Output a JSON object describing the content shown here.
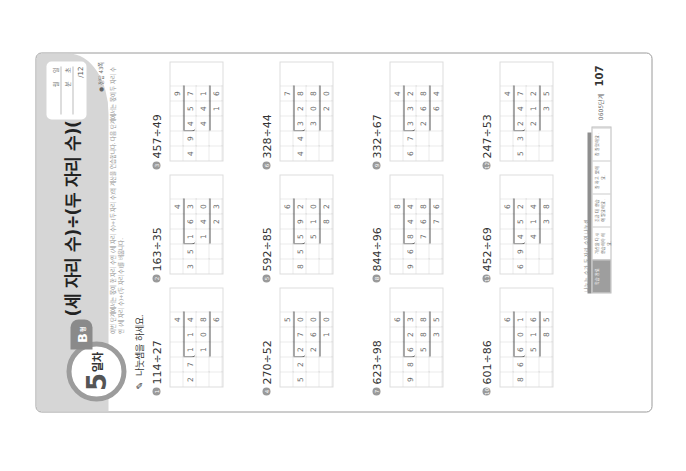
{
  "header": {
    "title": "(세 자리 수)÷(두 자리 수)(1)",
    "day_number": "5",
    "day_label": "일차",
    "type_letter": "B",
    "type_suffix": "형",
    "score_box": {
      "month_label": "월",
      "day_label": "일",
      "minute_label": "분",
      "second_label": "초",
      "total": "/12"
    },
    "answer_ref": "● 정답 43쪽",
    "description": "이번 단계에서는 몫이 한 자리 수인 (세 자리 수)÷(두 자리 수)의 계산을 연습합니다. 다음 단계에서는 몫이 두 자리 수인 (세 자리 수)÷(두 자리 수)를 배웁니다."
  },
  "prompt": {
    "icon": "pencil-icon",
    "text": "나눗셈을 하세요."
  },
  "problems": [
    {
      "num": "1",
      "label": "114÷27",
      "divisor": [
        "2",
        "7"
      ],
      "dividend": [
        "1",
        "1",
        "4"
      ],
      "quotient": "4",
      "product": [
        "1",
        "0",
        "8"
      ],
      "remainder": [
        "",
        "",
        "6"
      ]
    },
    {
      "num": "2",
      "label": "163÷35",
      "divisor": [
        "3",
        "5"
      ],
      "dividend": [
        "1",
        "6",
        "3"
      ],
      "quotient": "4",
      "product": [
        "1",
        "4",
        "0"
      ],
      "remainder": [
        "",
        "2",
        "3"
      ]
    },
    {
      "num": "3",
      "label": "457÷49",
      "divisor": [
        "4",
        "9"
      ],
      "dividend": [
        "4",
        "5",
        "7"
      ],
      "quotient": "9",
      "product": [
        "4",
        "4",
        "1"
      ],
      "remainder": [
        "",
        "1",
        "6"
      ]
    },
    {
      "num": "4",
      "label": "270÷52",
      "divisor": [
        "5",
        "2"
      ],
      "dividend": [
        "2",
        "7",
        "0"
      ],
      "quotient": "5",
      "product": [
        "2",
        "6",
        "0"
      ],
      "remainder": [
        "",
        "1",
        "0"
      ]
    },
    {
      "num": "5",
      "label": "592÷85",
      "divisor": [
        "8",
        "5"
      ],
      "dividend": [
        "5",
        "9",
        "2"
      ],
      "quotient": "6",
      "product": [
        "5",
        "1",
        "0"
      ],
      "remainder": [
        "",
        "8",
        "2"
      ]
    },
    {
      "num": "6",
      "label": "328÷44",
      "divisor": [
        "4",
        "4"
      ],
      "dividend": [
        "3",
        "2",
        "8"
      ],
      "quotient": "7",
      "product": [
        "3",
        "0",
        "8"
      ],
      "remainder": [
        "",
        "2",
        "0"
      ]
    },
    {
      "num": "7",
      "label": "623÷98",
      "divisor": [
        "9",
        "8"
      ],
      "dividend": [
        "6",
        "2",
        "3"
      ],
      "quotient": "6",
      "product": [
        "5",
        "8",
        "8"
      ],
      "remainder": [
        "",
        "3",
        "5"
      ]
    },
    {
      "num": "8",
      "label": "844÷96",
      "divisor": [
        "9",
        "6"
      ],
      "dividend": [
        "8",
        "4",
        "4"
      ],
      "quotient": "8",
      "product": [
        "7",
        "6",
        "8"
      ],
      "remainder": [
        "",
        "7",
        "6"
      ]
    },
    {
      "num": "9",
      "label": "332÷67",
      "divisor": [
        "6",
        "7"
      ],
      "dividend": [
        "3",
        "3",
        "2"
      ],
      "quotient": "4",
      "product": [
        "2",
        "6",
        "8"
      ],
      "remainder": [
        "",
        "6",
        "4"
      ]
    },
    {
      "num": "10",
      "label": "601÷86",
      "divisor": [
        "8",
        "6"
      ],
      "dividend": [
        "6",
        "0",
        "1"
      ],
      "quotient": "6",
      "product": [
        "5",
        "1",
        "6"
      ],
      "remainder": [
        "",
        "8",
        "5"
      ]
    },
    {
      "num": "11",
      "label": "452÷69",
      "divisor": [
        "6",
        "9"
      ],
      "dividend": [
        "4",
        "5",
        "2"
      ],
      "quotient": "6",
      "product": [
        "4",
        "1",
        "4"
      ],
      "remainder": [
        "",
        "3",
        "8"
      ]
    },
    {
      "num": "12",
      "label": "247÷53",
      "divisor": [
        "5",
        "3"
      ],
      "dividend": [
        "2",
        "4",
        "7"
      ],
      "quotient": "4",
      "product": [
        "2",
        "1",
        "2"
      ],
      "remainder": [
        "",
        "3",
        "5"
      ]
    }
  ],
  "footer": {
    "small_text": "나누는 수가 두 자리 수인 나눗셈",
    "table": [
      "학습 완료",
      "계산을 다시 연습해야 해요.",
      "조금 더 연습이 필요해요.",
      "잘 하고 있어요.",
      "참 잘했어요."
    ],
    "book_label": "0605단계",
    "page_number": "107"
  }
}
